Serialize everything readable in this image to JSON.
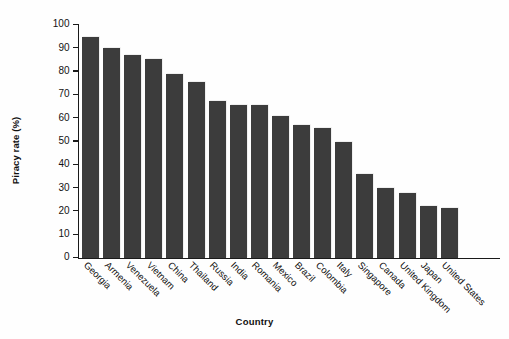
{
  "chart_data": {
    "type": "bar",
    "title": "",
    "xlabel": "Country",
    "ylabel": "Piracy rate (%)",
    "ylim": [
      0,
      100
    ],
    "ytick_step": 10,
    "yticks": [
      0,
      10,
      20,
      30,
      40,
      50,
      60,
      70,
      80,
      90,
      100
    ],
    "grid": false,
    "legend": false,
    "legend_position": "none",
    "bar_color": "#3c3c3c",
    "background_color": "#fefefe",
    "xtick_rotation": 45,
    "categories": [
      "Georgia",
      "Armenia",
      "Venezuela",
      "Vietnam",
      "China",
      "Thailand",
      "Russia",
      "India",
      "Romania",
      "Mexico",
      "Brazil",
      "Colombia",
      "Italy",
      "Singapore",
      "Canada",
      "United Kingdom",
      "Japan",
      "United States"
    ],
    "values": [
      95,
      90,
      87,
      85.5,
      79,
      75.5,
      67.5,
      65.5,
      65.5,
      61,
      57,
      56,
      50,
      36,
      30,
      28,
      22.5,
      21.5
    ]
  }
}
